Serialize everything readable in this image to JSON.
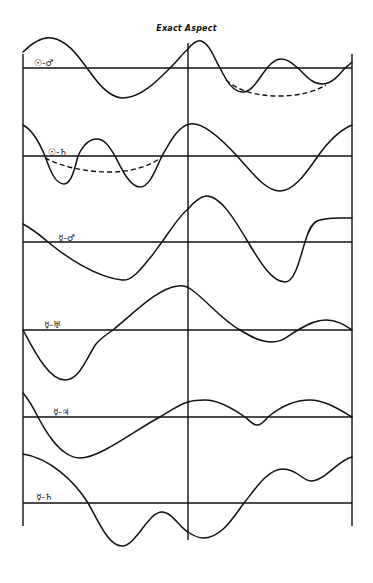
{
  "title": "Exact Aspect",
  "diagram": {
    "vertical_lines": {
      "left_x": 23,
      "center_x": 188,
      "right_x": 352
    },
    "line_color": "#111111",
    "background": "#ffffff",
    "panels": [
      {
        "label": "☉-♂",
        "label_pos": [
          34,
          58
        ],
        "baseline_y": 68,
        "curve": "M23,52 C33,42 42,36 52,38 C68,41 78,56 87,68 C97,82 108,97 122,98 C140,99 158,80 170,68 C178,60 184,52 188,49 C193,43 197,40 201,41 C210,44 214,58 220,68 C226,80 232,91 242,92 C252,93 259,78 267,68 C272,62 276,59 281,59 C289,59 294,65 300,70 C307,77 313,84 322,84 C332,84 340,74 345,68 C348,66 350,64 352,62",
        "dashed": "M226,80 C240,92 258,96 280,96 C302,96 318,90 326,85"
      },
      {
        "label": "☉-♄",
        "label_pos": [
          48,
          147
        ],
        "baseline_y": 156,
        "curve": "M23,125 C33,130 40,144 45,156 C50,170 55,184 64,184 C72,184 75,166 78,156 C83,145 89,139 97,139 C105,139 110,148 115,156 C122,170 130,187 140,187 C150,187 156,168 162,156 C170,142 178,126 190,124 C200,122 215,132 237,156 C252,172 265,191 280,191 C295,191 308,170 318,156 C328,142 340,130 352,125",
        "dashed": "M45,158 C65,168 88,172 110,172 C132,172 150,166 162,157"
      },
      {
        "label": "☿-♂",
        "label_pos": [
          58,
          233
        ],
        "baseline_y": 242,
        "curve": "M23,224 C32,229 40,235 48,242 C65,256 95,277 122,280 C132,281 140,270 150,258 C155,252 158,247 162,242 C172,228 180,215 188,209 C193,203 199,197 206,196 C220,195 235,220 248,242 C260,262 272,282 285,282 C295,282 300,258 305,242 C308,232 311,224 317,221 C324,218 332,218 340,218 C345,218 349,218 352,218",
        "dashed": ""
      },
      {
        "label": "☿-♅",
        "label_pos": [
          44,
          320
        ],
        "baseline_y": 330,
        "curve": "M23,330 C33,348 48,380 65,380 C80,380 88,355 96,344 C101,338 107,334 113,330 C135,312 158,288 178,286 C184,285 188,287 192,290 C206,300 222,320 240,330 C250,336 260,342 272,342 C284,342 290,334 298,330 C308,324 316,320 326,320 C338,320 346,326 352,330",
        "dashed": ""
      },
      {
        "label": "☿-♃",
        "label_pos": [
          53,
          407
        ],
        "baseline_y": 417,
        "curve": "M23,393 C29,400 34,409 38,417 C48,436 62,458 80,458 C100,458 135,430 160,417 C170,411 180,404 188,402 C194,400 199,400 205,400 C220,400 235,410 245,417 C250,421 253,425 257,425 C262,425 265,420 268,417 C280,407 295,400 310,400 C325,400 340,410 352,417",
        "dashed": ""
      },
      {
        "label": "☿-♄",
        "label_pos": [
          36,
          492
        ],
        "baseline_y": 503,
        "curve": "M23,454 C50,458 75,482 88,503 C98,520 108,546 122,546 C136,546 148,512 162,512 C172,512 180,528 188,532 C194,536 198,538 203,538 C222,538 234,516 244,503 C256,488 268,469 283,469 C297,469 303,481 311,481 C325,481 338,460 352,457",
        "dashed": ""
      }
    ]
  }
}
